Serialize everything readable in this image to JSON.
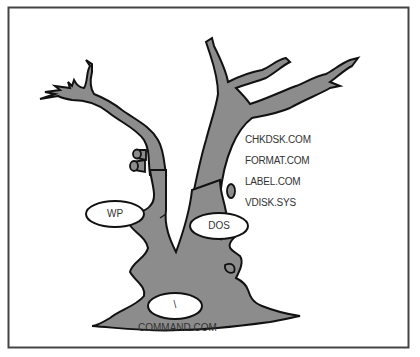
{
  "diagram": {
    "colors": {
      "trunk_fill": "#8c8c8c",
      "outline": "#111111",
      "border": "#444444",
      "background": "#ffffff",
      "text": "#333333"
    },
    "nodes": [
      {
        "id": "root",
        "label": "\\",
        "caption": "COMMAND.COM"
      },
      {
        "id": "wp",
        "label": "WP"
      },
      {
        "id": "dos",
        "label": "DOS"
      }
    ],
    "dos_files": [
      "CHKDSK.COM",
      "FORMAT.COM",
      "LABEL.COM",
      "VDISK.SYS"
    ]
  }
}
